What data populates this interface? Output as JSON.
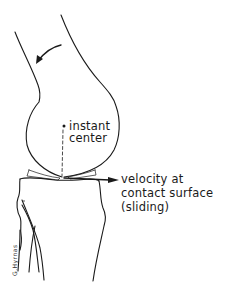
{
  "figure": {
    "labels": {
      "instant_center_line1": "instant",
      "instant_center_line2": "center",
      "velocity_line1": "velocity at",
      "velocity_line2": "contact surface",
      "velocity_line3": "(sliding)"
    },
    "signature": "G.Hyrnas",
    "colors": {
      "line": "#1a1a1a",
      "background": "#ffffff"
    }
  }
}
